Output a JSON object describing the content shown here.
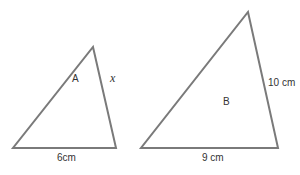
{
  "diagram": {
    "stroke_color": "#7a7a7a",
    "text_color": "#333333",
    "triangles": [
      {
        "name": "A",
        "label": "A",
        "base_label": "6cm",
        "side_label": "x",
        "vertices": [
          [
            13,
            148
          ],
          [
            116,
            148
          ],
          [
            93,
            47
          ]
        ]
      },
      {
        "name": "B",
        "label": "B",
        "base_label": "9 cm",
        "side_label": "10 cm",
        "vertices": [
          [
            141,
            148
          ],
          [
            278,
            148
          ],
          [
            248,
            12
          ]
        ]
      }
    ]
  }
}
